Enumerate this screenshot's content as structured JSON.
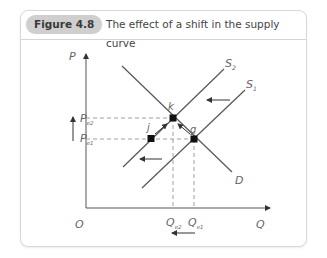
{
  "figure": {
    "badge": "Figure 4.8",
    "title": "The effect of a shift in the supply curve"
  },
  "diagram": {
    "axes": {
      "y_label": "P",
      "x_label": "Q",
      "origin_label": "O"
    },
    "curves": [
      {
        "name": "S2",
        "label": "S",
        "sub": "2"
      },
      {
        "name": "S1",
        "label": "S",
        "sub": "1"
      },
      {
        "name": "D",
        "label": "D"
      }
    ],
    "points": [
      {
        "name": "k",
        "label": "k"
      },
      {
        "name": "j",
        "label": "j"
      },
      {
        "name": "g",
        "label": "g"
      }
    ],
    "price_labels": [
      {
        "label": "P",
        "sub": "e2"
      },
      {
        "label": "P",
        "sub": "e1"
      }
    ],
    "quantity_labels": [
      {
        "label": "Q",
        "sub": "e2"
      },
      {
        "label": "Q",
        "sub": "e1"
      }
    ],
    "colors": {
      "line": "#555555",
      "dash": "#888888",
      "point": "#111111",
      "badge_bg": "#cfcfcf"
    }
  }
}
